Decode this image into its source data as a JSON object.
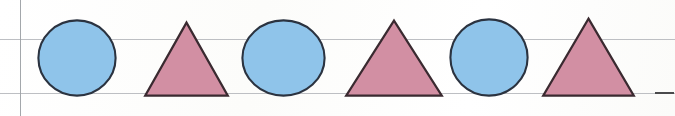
{
  "page": {
    "caption": "Repeating pattern of blue circles and pink triangles drawn on ruled paper",
    "width": 675,
    "height": 116,
    "background_color": "#fdfdfc"
  },
  "palette": {
    "circle_fill": "#8fc4ea",
    "circle_stroke": "#2b3340",
    "triangle_fill": "#d28fa3",
    "triangle_stroke": "#3a2a30",
    "rule_line": "#b9bcc0",
    "margin_line": "#9ea2a7",
    "tick_mark": "#4a4a4c"
  },
  "guides": {
    "margin_line": {
      "label": "left margin rule",
      "x": 20
    },
    "rules": [
      {
        "label": "upper ruled line",
        "y": 39,
        "x": 0,
        "width": 675
      },
      {
        "label": "lower ruled line",
        "y": 93,
        "x": 0,
        "width": 675
      }
    ],
    "tick": {
      "label": "baseline tick mark",
      "x": 655,
      "y": 92,
      "width": 19
    }
  },
  "pattern": {
    "description": "circle, triangle, circle, triangle, circle, triangle",
    "unit": "circle-triangle",
    "repeats": 3,
    "count": 6,
    "shapes": [
      {
        "index": 1,
        "type": "circle",
        "color_name": "blue",
        "fill": "#8fc4ea",
        "x": 37,
        "y": 19,
        "width": 80,
        "height": 78
      },
      {
        "index": 2,
        "type": "triangle",
        "color_name": "pink",
        "fill": "#d28fa3",
        "x": 144,
        "y": 21,
        "width": 85,
        "height": 76
      },
      {
        "index": 3,
        "type": "circle",
        "color_name": "blue",
        "fill": "#8fc4ea",
        "x": 241,
        "y": 19,
        "width": 85,
        "height": 78
      },
      {
        "index": 4,
        "type": "triangle",
        "color_name": "pink",
        "fill": "#d28fa3",
        "x": 345,
        "y": 19,
        "width": 98,
        "height": 78
      },
      {
        "index": 5,
        "type": "circle",
        "color_name": "blue",
        "fill": "#8fc4ea",
        "x": 449,
        "y": 18,
        "width": 80,
        "height": 79
      },
      {
        "index": 6,
        "type": "triangle",
        "color_name": "pink",
        "fill": "#d28fa3",
        "x": 542,
        "y": 17,
        "width": 93,
        "height": 80
      }
    ]
  }
}
